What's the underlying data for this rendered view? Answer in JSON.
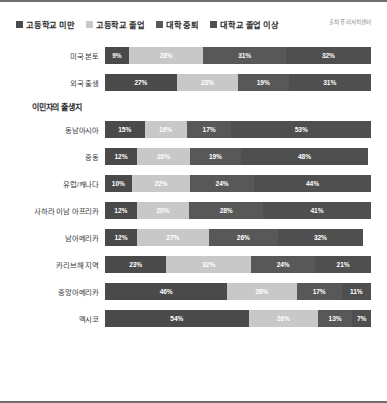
{
  "source_note": "출처 퓨 리서치센터",
  "section_title": "이민자의 출생지",
  "legend": [
    {
      "label": "고등학교 미만",
      "color": "#4a4a4a"
    },
    {
      "label": "고등학교 졸업",
      "color": "#c8c8c8"
    },
    {
      "label": "대학 중퇴",
      "color": "#585858"
    },
    {
      "label": "대학교 졸업 이상",
      "color": "#4f4f4f"
    }
  ],
  "chart_data": {
    "type": "bar",
    "orientation": "horizontal",
    "stacked": true,
    "stacked_100": true,
    "title": "",
    "subtitle": "",
    "xlabel": "",
    "ylabel": "",
    "xlim": [
      0,
      100
    ],
    "grid": false,
    "legend_position": "top-left",
    "series": [
      {
        "name": "고등학교 미만",
        "color": "#4a4a4a",
        "values": [
          9,
          27,
          15,
          12,
          10,
          12,
          12,
          23,
          46,
          54
        ]
      },
      {
        "name": "고등학교 졸업",
        "color": "#c8c8c8",
        "values": [
          28,
          23,
          16,
          20,
          22,
          20,
          27,
          32,
          26,
          26
        ]
      },
      {
        "name": "대학 중퇴",
        "color": "#585858",
        "values": [
          31,
          19,
          17,
          19,
          24,
          28,
          26,
          24,
          17,
          13
        ]
      },
      {
        "name": "대학교 졸업 이상",
        "color": "#4f4f4f",
        "values": [
          32,
          31,
          53,
          48,
          44,
          41,
          32,
          21,
          11,
          7
        ]
      }
    ],
    "categories": [
      "미국 본토",
      "외국 출생",
      "동남아시아",
      "중동",
      "유럽/캐나다",
      "사하라 이남 아프리카",
      "남아메리카",
      "카리브해 지역",
      "중앙아메리카",
      "멕시코"
    ]
  },
  "groups": [
    {
      "id": "top",
      "title": "",
      "rows": [
        {
          "label": "미국 본토",
          "segments": [
            {
              "value": "9%",
              "pct": 9
            },
            {
              "value": "28%",
              "pct": 28
            },
            {
              "value": "31%",
              "pct": 31
            },
            {
              "value": "32%",
              "pct": 32
            }
          ]
        },
        {
          "label": "외국 출생",
          "segments": [
            {
              "value": "27%",
              "pct": 27
            },
            {
              "value": "23%",
              "pct": 23
            },
            {
              "value": "19%",
              "pct": 19
            },
            {
              "value": "31%",
              "pct": 31
            }
          ]
        }
      ]
    },
    {
      "id": "birthplace",
      "title": "이민자의 출생지",
      "rows": [
        {
          "label": "동남아시아",
          "segments": [
            {
              "value": "15%",
              "pct": 15
            },
            {
              "value": "16%",
              "pct": 16
            },
            {
              "value": "17%",
              "pct": 17
            },
            {
              "value": "53%",
              "pct": 53
            }
          ]
        },
        {
          "label": "중동",
          "segments": [
            {
              "value": "12%",
              "pct": 12
            },
            {
              "value": "20%",
              "pct": 20
            },
            {
              "value": "19%",
              "pct": 19
            },
            {
              "value": "48%",
              "pct": 48
            }
          ]
        },
        {
          "label": "유럽/캐나다",
          "segments": [
            {
              "value": "10%",
              "pct": 10
            },
            {
              "value": "22%",
              "pct": 22
            },
            {
              "value": "24%",
              "pct": 24
            },
            {
              "value": "44%",
              "pct": 44
            }
          ]
        },
        {
          "label": "사하라 이남 아프리카",
          "segments": [
            {
              "value": "12%",
              "pct": 12
            },
            {
              "value": "20%",
              "pct": 20
            },
            {
              "value": "28%",
              "pct": 28
            },
            {
              "value": "41%",
              "pct": 41
            }
          ]
        },
        {
          "label": "남아메리카",
          "segments": [
            {
              "value": "12%",
              "pct": 12
            },
            {
              "value": "27%",
              "pct": 27
            },
            {
              "value": "26%",
              "pct": 26
            },
            {
              "value": "32%",
              "pct": 32
            }
          ]
        },
        {
          "label": "카리브해 지역",
          "segments": [
            {
              "value": "23%",
              "pct": 23
            },
            {
              "value": "32%",
              "pct": 32
            },
            {
              "value": "24%",
              "pct": 24
            },
            {
              "value": "21%",
              "pct": 21
            }
          ]
        },
        {
          "label": "중앙아메리카",
          "segments": [
            {
              "value": "46%",
              "pct": 46
            },
            {
              "value": "26%",
              "pct": 26
            },
            {
              "value": "17%",
              "pct": 17
            },
            {
              "value": "11%",
              "pct": 11
            }
          ]
        },
        {
          "label": "멕시코",
          "segments": [
            {
              "value": "54%",
              "pct": 54
            },
            {
              "value": "26%",
              "pct": 26
            },
            {
              "value": "13%",
              "pct": 13
            },
            {
              "value": "7%",
              "pct": 7
            }
          ]
        }
      ]
    }
  ]
}
